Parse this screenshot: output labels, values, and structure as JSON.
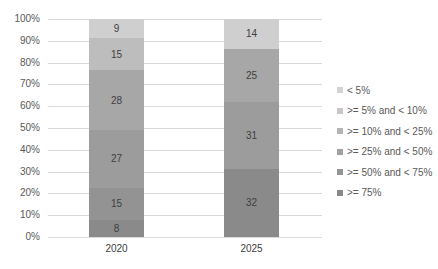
{
  "chart_data": {
    "type": "bar",
    "stacked": true,
    "percent_stacked": true,
    "title": "",
    "xlabel": "",
    "ylabel": "",
    "ylim": [
      0,
      100
    ],
    "y_ticks": [
      "0%",
      "10%",
      "20%",
      "30%",
      "40%",
      "50%",
      "60%",
      "70%",
      "80%",
      "90%",
      "100%"
    ],
    "categories": [
      "2020",
      "2025"
    ],
    "series": [
      {
        "name": ">= 75%",
        "color": "#8a8a8a",
        "values": [
          8,
          32
        ]
      },
      {
        "name": ">= 50% and < 75%",
        "color": "#939393",
        "values": [
          15,
          0
        ]
      },
      {
        "name": ">= 25% and < 50%",
        "color": "#9c9c9c",
        "values": [
          27,
          31
        ]
      },
      {
        "name": ">= 10% and < 25%",
        "color": "#a7a7a7",
        "values": [
          28,
          25
        ]
      },
      {
        "name": ">= 5% and < 10%",
        "color": "#bdbdbd",
        "values": [
          15,
          0
        ]
      },
      {
        "name": "< 5%",
        "color": "#cfcfcf",
        "values": [
          9,
          14
        ]
      }
    ],
    "grid": true,
    "legend_position": "right"
  },
  "legend": [
    {
      "label": "< 5%",
      "color": "#d3d3d3"
    },
    {
      "label": ">= 5% and < 10%",
      "color": "#c8c8c8"
    },
    {
      "label": ">= 10% and < 25%",
      "color": "#b4b4b4"
    },
    {
      "label": ">= 25% and < 50%",
      "color": "#a0a0a0"
    },
    {
      "label": ">= 50% and < 75%",
      "color": "#949494"
    },
    {
      "label": ">= 75%",
      "color": "#888888"
    }
  ]
}
